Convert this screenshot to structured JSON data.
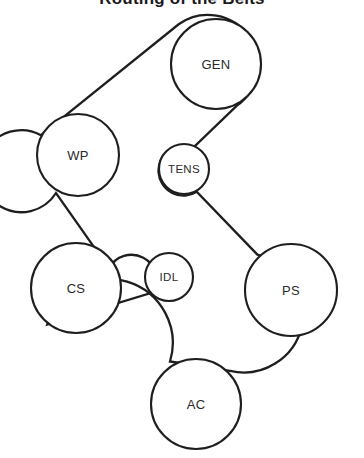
{
  "diagram": {
    "title": "Routing of the Belts",
    "background_color": "#ffffff",
    "line_color": "#1e1e1e",
    "label_color": "#2a2a2a",
    "width": 364,
    "height": 458,
    "pulleys": [
      {
        "id": "gen",
        "label": "GEN",
        "cx": 216,
        "cy": 64,
        "r": 45,
        "label_size": "normal"
      },
      {
        "id": "wp",
        "label": "WP",
        "cx": 78,
        "cy": 155,
        "r": 41,
        "label_size": "normal"
      },
      {
        "id": "tens",
        "label": "TENS",
        "cx": 184,
        "cy": 169,
        "r": 25,
        "label_size": "small"
      },
      {
        "id": "cs",
        "label": "CS",
        "cx": 76,
        "cy": 288,
        "r": 45,
        "label_size": "normal"
      },
      {
        "id": "idl",
        "label": "IDL",
        "cx": 169,
        "cy": 277,
        "r": 24,
        "label_size": "small"
      },
      {
        "id": "ps",
        "label": "PS",
        "cx": 291,
        "cy": 290,
        "r": 46,
        "label_size": "normal"
      },
      {
        "id": "ac",
        "label": "AC",
        "cx": 196,
        "cy": 404,
        "r": 45,
        "label_size": "normal"
      }
    ],
    "belt_path": "M 41.0 135.2 L 179.0 24.0 A 45 45 0 1 1 236.6 105.9 L 193.3 147.6 A 25 25 0 1 0 196.7 191.8 L 257.4 254.6 A 46 46 0 1 1 230.0 370.9 L 170.0 361.5 A 45 45 0 1 0 47.2 324.5 L 154.0 292.0 A 24 24 0 1 0 109.0 268.4 L 56.0 193.0 A 41 41 0 1 1 41.0 135.2 Z",
    "belt_segments": [
      {
        "from": "wp",
        "to": "gen",
        "description": "WP upper-left tangent to GEN upper-left"
      },
      {
        "from": "gen",
        "to": "tens",
        "description": "GEN lower-left crossing down to TENS upper-right"
      },
      {
        "from": "tens",
        "to": "ps",
        "description": "TENS lower-left across to PS upper-right"
      },
      {
        "from": "ps",
        "to": "ac",
        "description": "PS lower-right down to AC right side"
      },
      {
        "from": "ac",
        "to": "cs",
        "description": "AC left side up-left to CS lower-left"
      },
      {
        "from": "cs",
        "to": "idl",
        "description": "CS right side to IDL lower-left"
      },
      {
        "from": "idl",
        "to": "wp",
        "description": "IDL upper-left up to WP lower-right"
      }
    ]
  }
}
